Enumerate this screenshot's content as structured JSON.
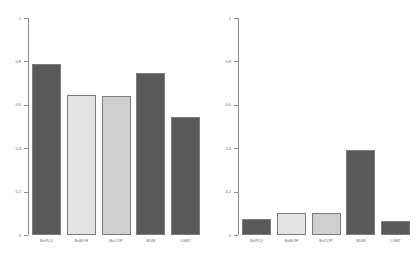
{
  "figure": {
    "background": "#ffffff",
    "panel_count": 2
  },
  "chart_data": [
    {
      "type": "bar",
      "panel": "left",
      "title": "",
      "xlabel": "",
      "ylabel": "",
      "categories": [
        "BsPLU",
        "BsBOR",
        "BsCOP",
        "BUM",
        "LGBT"
      ],
      "values": [
        0.79,
        0.645,
        0.64,
        0.745,
        0.545
      ],
      "ylim": [
        0,
        1
      ],
      "yticks": [
        0,
        0.2,
        0.4,
        0.6,
        0.8,
        1
      ],
      "ytick_labels": [
        "0",
        "0.2",
        "0.4",
        "0.6",
        "0.8",
        "1"
      ],
      "bar_colors": [
        "#595959",
        "#e3e3e3",
        "#cfcfcf",
        "#595959",
        "#595959"
      ],
      "bar_border": "#7d7d7d",
      "grid": false,
      "legend": "none"
    },
    {
      "type": "bar",
      "panel": "right",
      "title": "",
      "xlabel": "",
      "ylabel": "",
      "categories": [
        "BsPLU",
        "BsBOR",
        "BsCOP",
        "BUM",
        "LGBT"
      ],
      "values": [
        0.075,
        0.1,
        0.1,
        0.39,
        0.065
      ],
      "ylim": [
        0,
        1
      ],
      "yticks": [
        0,
        0.2,
        0.4,
        0.6,
        0.8,
        1
      ],
      "ytick_labels": [
        "0",
        "0.2",
        "0.4",
        "0.6",
        "0.8",
        "1"
      ],
      "bar_colors": [
        "#595959",
        "#e3e3e3",
        "#cfcfcf",
        "#595959",
        "#595959"
      ],
      "bar_border": "#7d7d7d",
      "grid": false,
      "legend": "none"
    }
  ]
}
